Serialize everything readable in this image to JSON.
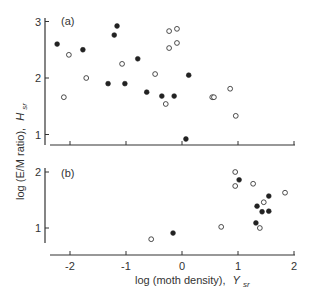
{
  "chart_data": [
    {
      "panel": "(a)",
      "type": "scatter",
      "title": "",
      "xlabel": "log (moth density), Y_sr",
      "ylabel": "log (E/M ratio), H_sr",
      "xlim": [
        -2.3,
        2.0
      ],
      "ylim": [
        0.8,
        3.05
      ],
      "xticks": [
        -2,
        -1,
        0,
        1,
        2
      ],
      "yticks": [
        1,
        2,
        3
      ],
      "grid": false,
      "legend": null,
      "series": [
        {
          "name": "filled",
          "marker": "filled-circle",
          "points": [
            [
              -2.23,
              2.6
            ],
            [
              -1.77,
              2.5
            ],
            [
              -1.21,
              2.76
            ],
            [
              -1.16,
              2.92
            ],
            [
              -1.32,
              1.9
            ],
            [
              -1.02,
              1.9
            ],
            [
              -0.79,
              2.34
            ],
            [
              -0.63,
              1.75
            ],
            [
              -0.36,
              1.68
            ],
            [
              -0.14,
              1.68
            ],
            [
              0.12,
              2.05
            ],
            [
              0.07,
              0.92
            ]
          ]
        },
        {
          "name": "open",
          "marker": "open-circle",
          "points": [
            [
              -2.02,
              2.41
            ],
            [
              -2.11,
              1.66
            ],
            [
              -1.71,
              2.0
            ],
            [
              -1.07,
              2.25
            ],
            [
              -0.48,
              2.07
            ],
            [
              -0.29,
              1.54
            ],
            [
              -0.23,
              2.83
            ],
            [
              -0.09,
              2.87
            ],
            [
              -0.23,
              2.53
            ],
            [
              -0.09,
              2.62
            ],
            [
              0.54,
              1.66
            ],
            [
              0.57,
              1.66
            ],
            [
              0.86,
              1.81
            ],
            [
              0.96,
              1.33
            ]
          ]
        }
      ]
    },
    {
      "panel": "(b)",
      "type": "scatter",
      "title": "",
      "xlabel": "log (moth density), Y_sr",
      "ylabel": "log (E/M ratio), H_sr",
      "xlim": [
        -2.3,
        2.0
      ],
      "ylim": [
        0.7,
        2.05
      ],
      "xticks": [
        -2,
        -1,
        0,
        1,
        2
      ],
      "yticks": [
        1,
        2
      ],
      "grid": false,
      "legend": null,
      "series": [
        {
          "name": "filled",
          "marker": "filled-circle",
          "points": [
            [
              1.02,
              1.86
            ],
            [
              -0.16,
              0.91
            ],
            [
              1.34,
              1.39
            ],
            [
              1.55,
              1.57
            ],
            [
              1.43,
              1.29
            ],
            [
              1.55,
              1.3
            ],
            [
              1.32,
              1.09
            ]
          ]
        },
        {
          "name": "open",
          "marker": "open-circle",
          "points": [
            [
              0.95,
              2.0
            ],
            [
              0.95,
              1.75
            ],
            [
              1.27,
              1.79
            ],
            [
              1.84,
              1.63
            ],
            [
              1.46,
              1.46
            ],
            [
              1.39,
              1.0
            ],
            [
              0.7,
              1.02
            ],
            [
              -0.55,
              0.8
            ]
          ]
        }
      ]
    }
  ],
  "labels": {
    "panel_a": "(a)",
    "panel_b": "(b)",
    "ylabel_main": "log (E/M ratio),",
    "ylabel_var": "H",
    "ylabel_sub": "sr",
    "xlabel_main": "log (moth density),",
    "xlabel_var": "Y",
    "xlabel_sub": "sr"
  },
  "colors": {
    "ink": "#222222",
    "axis": "#333333",
    "background": "#ffffff"
  }
}
